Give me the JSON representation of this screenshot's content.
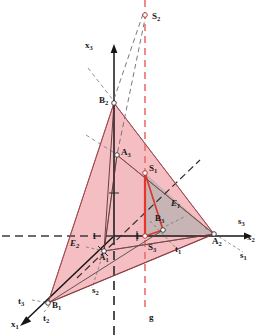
{
  "figure": {
    "colors": {
      "plane_e2_fill": "#f6c3c6",
      "plane_e2_stroke": "#b05055",
      "plane_e1_fill": "#c9c9c9",
      "plane_e1_stroke": "#4d4d4d",
      "axis": "#151515",
      "red_line": "#e8342a",
      "red_dashed": "#e8605c",
      "dash_gray": "#3c3c3c",
      "thin_gray": "#6e6e6e",
      "background": "#ffffff"
    },
    "axes": [
      {
        "name": "x1",
        "label": "x",
        "sub": "1"
      },
      {
        "name": "x2",
        "label": "x",
        "sub": "2"
      },
      {
        "name": "x3",
        "label": "x",
        "sub": "3"
      }
    ],
    "trace_lines": [
      {
        "name": "s1",
        "label": "s",
        "sub": "1"
      },
      {
        "name": "s2",
        "label": "s",
        "sub": "2"
      },
      {
        "name": "s3",
        "label": "s",
        "sub": "3"
      },
      {
        "name": "t1",
        "label": "t",
        "sub": "1"
      },
      {
        "name": "t2",
        "label": "t",
        "sub": "2"
      },
      {
        "name": "t3",
        "label": "t",
        "sub": "3"
      }
    ],
    "points": [
      {
        "name": "A1",
        "label": "A",
        "sub": "1",
        "x": 104,
        "y": 251
      },
      {
        "name": "A2",
        "label": "A",
        "sub": "2",
        "x": 214,
        "y": 234
      },
      {
        "name": "A3",
        "label": "A",
        "sub": "3",
        "x": 117,
        "y": 155
      },
      {
        "name": "B1",
        "label": "B",
        "sub": "1",
        "x": 48,
        "y": 303
      },
      {
        "name": "B2",
        "label": "B",
        "sub": "2",
        "x": 114,
        "y": 103
      },
      {
        "name": "B3",
        "label": "B",
        "sub": "3",
        "x": 163,
        "y": 230
      },
      {
        "name": "S1",
        "label": "S",
        "sub": "1",
        "x": 145,
        "y": 173
      },
      {
        "name": "S2",
        "label": "S",
        "sub": "2",
        "x": 145,
        "y": 15
      },
      {
        "name": "S3",
        "label": "S",
        "sub": "3",
        "x": 145,
        "y": 234
      }
    ],
    "planes": [
      {
        "name": "E1",
        "label": "E",
        "sub": "1"
      },
      {
        "name": "E2",
        "label": "E",
        "sub": "2"
      }
    ],
    "unit_marks": [
      {
        "name": "unit-mark-left",
        "label": "1",
        "x": 94,
        "y": 237
      },
      {
        "name": "unit-mark-right",
        "label": "1",
        "x": 137,
        "y": 237
      }
    ],
    "intersection_line": {
      "name": "g",
      "label": "g",
      "x": 150,
      "y": 316
    }
  }
}
